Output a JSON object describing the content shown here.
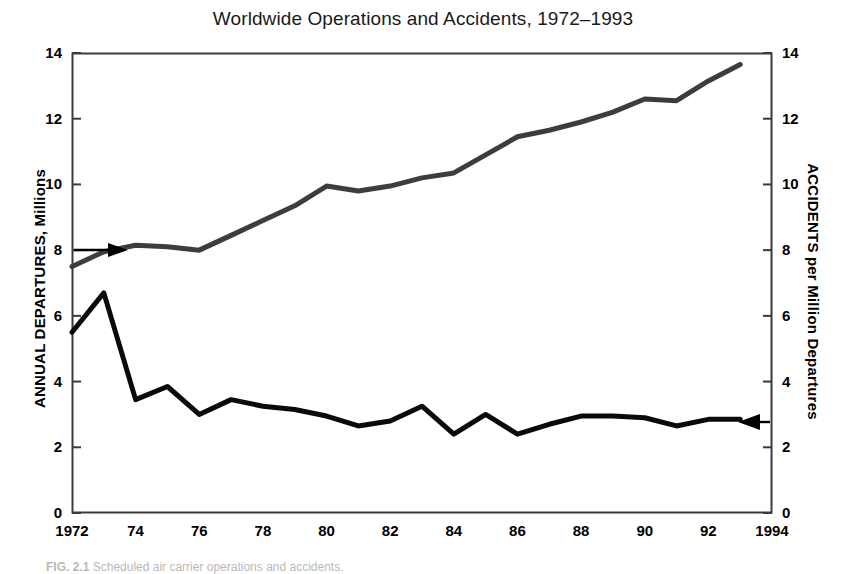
{
  "figure": {
    "title": "Worldwide Operations and Accidents, 1972–1993",
    "caption_label": "FIG. 2.1",
    "caption_text": "Scheduled air carrier operations and accidents.",
    "background_color": "#ffffff",
    "frame_color": "#333333"
  },
  "axes": {
    "left": {
      "title": "ANNUAL DEPARTURES, Millions",
      "ticks": [
        "0",
        "2",
        "4",
        "6",
        "8",
        "10",
        "12",
        "14"
      ],
      "min": 0,
      "max": 14
    },
    "right": {
      "title": "ACCIDENTS per Million Departures",
      "ticks": [
        "0",
        "2",
        "4",
        "6",
        "8",
        "10",
        "12",
        "14"
      ],
      "min": 0,
      "max": 14
    },
    "x": {
      "ticks": [
        "1972",
        "74",
        "76",
        "78",
        "80",
        "82",
        "84",
        "86",
        "88",
        "90",
        "92",
        "1994"
      ],
      "min": 1972,
      "max": 1994
    }
  },
  "annotations": {
    "left_arrow": {
      "name": "departures-pointer",
      "points_to": "departures",
      "direction": "right",
      "value": 8.1
    },
    "right_arrow": {
      "name": "accidents-pointer",
      "points_to": "accidents",
      "direction": "left",
      "value": 2.85
    }
  },
  "chart_data": {
    "type": "line",
    "title": "Worldwide Operations and Accidents, 1972–1993",
    "xlabel": "",
    "ylabel": "ANNUAL DEPARTURES, Millions",
    "y2label": "ACCIDENTS per Million Departures",
    "xlim": [
      1972,
      1994
    ],
    "ylim": [
      0,
      14
    ],
    "y2lim": [
      0,
      14
    ],
    "grid": false,
    "legend": "none",
    "x": [
      1972,
      1973,
      1974,
      1975,
      1976,
      1977,
      1978,
      1979,
      1980,
      1981,
      1982,
      1983,
      1984,
      1985,
      1986,
      1987,
      1988,
      1989,
      1990,
      1991,
      1992,
      1993
    ],
    "series": [
      {
        "name": "Annual Departures, Millions",
        "axis": "left",
        "color": "#3d3d3d",
        "width": 5,
        "values": [
          7.5,
          7.95,
          8.15,
          8.1,
          8.0,
          8.45,
          8.9,
          9.35,
          9.95,
          9.8,
          9.95,
          10.2,
          10.35,
          10.9,
          11.45,
          11.65,
          11.9,
          12.2,
          12.6,
          12.55,
          13.15,
          13.65
        ]
      },
      {
        "name": "Accidents per Million Departures",
        "axis": "right",
        "color": "#0a0a0a",
        "width": 5,
        "values": [
          5.5,
          6.7,
          3.45,
          3.85,
          3.0,
          3.45,
          3.25,
          3.15,
          2.95,
          2.65,
          2.8,
          3.25,
          2.4,
          3.0,
          2.4,
          2.7,
          2.95,
          2.95,
          2.9,
          2.65,
          2.85,
          2.85
        ]
      }
    ]
  }
}
